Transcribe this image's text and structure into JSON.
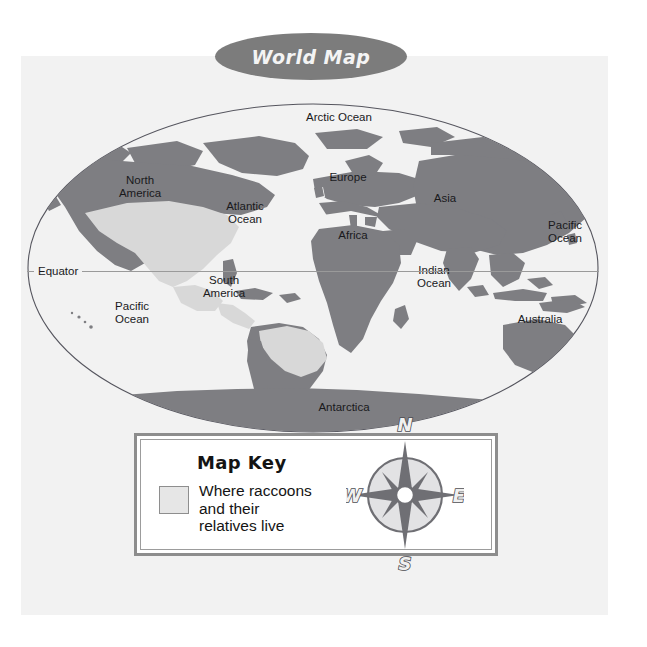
{
  "title": {
    "text": "World Map",
    "banner_color": "#7c7c7c",
    "text_color": "#f4f4f4"
  },
  "page": {
    "background_color": "#f2f2f2",
    "outer_background_color": "#ffffff"
  },
  "map": {
    "land_color": "#7e7e82",
    "highlight_color": "#d8d8d8",
    "ocean_color": "#f2f2f2",
    "outline_color": "#4a4a52",
    "labels": [
      {
        "name": "arctic-ocean",
        "text": "Arctic Ocean",
        "x": 312,
        "y": 117,
        "type": "ocean"
      },
      {
        "name": "north-america",
        "text": "North\nAmerica",
        "x": 113,
        "y": 180,
        "type": "continent"
      },
      {
        "name": "atlantic-ocean",
        "text": "Atlantic\nOcean",
        "x": 218,
        "y": 206,
        "type": "ocean"
      },
      {
        "name": "europe",
        "text": "Europe",
        "x": 320,
        "y": 177,
        "type": "continent"
      },
      {
        "name": "asia",
        "text": "Asia",
        "x": 418,
        "y": 198,
        "type": "continent"
      },
      {
        "name": "africa",
        "text": "Africa",
        "x": 325,
        "y": 235,
        "type": "continent"
      },
      {
        "name": "pacific-ocean-east",
        "text": "Pacific\nOcean",
        "x": 538,
        "y": 225,
        "type": "ocean"
      },
      {
        "name": "indian-ocean",
        "text": "Indian\nOcean",
        "x": 407,
        "y": 270,
        "type": "ocean"
      },
      {
        "name": "south-america",
        "text": "South\nAmerica",
        "x": 197,
        "y": 280,
        "type": "continent"
      },
      {
        "name": "pacific-ocean-west",
        "text": "Pacific\nOcean",
        "x": 105,
        "y": 306,
        "type": "ocean"
      },
      {
        "name": "australia",
        "text": "Australia",
        "x": 512,
        "y": 316,
        "type": "continent"
      },
      {
        "name": "antarctica",
        "text": "Antarctica",
        "x": 316,
        "y": 407,
        "type": "continent"
      }
    ],
    "equator_label": "Equator"
  },
  "map_key": {
    "title": "Map Key",
    "legend_label": "Where raccoons\nand their\nrelatives live",
    "swatch_color": "#e6e6e6",
    "border_color": "#8d8d8d"
  },
  "compass": {
    "north": "N",
    "south": "S",
    "east": "E",
    "west": "W",
    "star_color": "#6f6f74",
    "disc_color": "#e2e2e4"
  }
}
